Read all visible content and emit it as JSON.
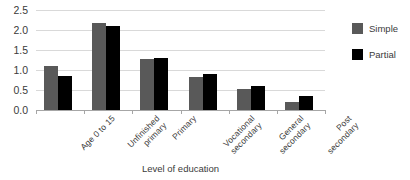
{
  "chart_data": {
    "type": "bar",
    "title": "",
    "xlabel": "Level of education",
    "ylabel": "",
    "ylim": [
      0.0,
      2.5
    ],
    "yticks": [
      "0.0",
      "0.5",
      "1.0",
      "1.5",
      "2.0",
      "2.5"
    ],
    "ytick_values": [
      0.0,
      0.5,
      1.0,
      1.5,
      2.0,
      2.5
    ],
    "grid": true,
    "legend_position": "right",
    "categories": [
      "Age 0 to 15",
      "Unfinished primary",
      "Primary",
      "Vocational secondary",
      "General secondary",
      "Post secondary"
    ],
    "category_lines": [
      [
        "Age 0 to 15"
      ],
      [
        "Unfinished",
        "primary"
      ],
      [
        "Primary"
      ],
      [
        "Vocational",
        "secondary"
      ],
      [
        "General",
        "secondary"
      ],
      [
        "Post",
        "secondary"
      ]
    ],
    "series": [
      {
        "name": "Simple",
        "color": "#595959",
        "values": [
          1.1,
          2.17,
          1.28,
          0.82,
          0.52,
          0.2
        ]
      },
      {
        "name": "Partial",
        "color": "#000000",
        "values": [
          0.85,
          2.1,
          1.3,
          0.9,
          0.6,
          0.35
        ]
      }
    ]
  },
  "colors": {
    "simple": "#595959",
    "partial": "#000000",
    "gridline": "#d9d9d9",
    "axis": "#a6a6a6",
    "text": "#3a3a3a",
    "background": "#ffffff"
  }
}
